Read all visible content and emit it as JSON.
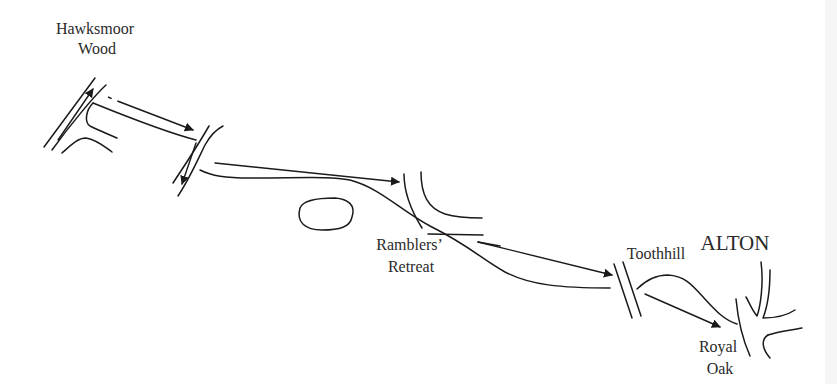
{
  "diagram": {
    "type": "route-map-sketch",
    "colors": {
      "ink": "#1a1a1a",
      "text": "#2a2a2a",
      "background": "#ffffff"
    },
    "places": [
      {
        "id": "hawksmoor-wood",
        "lines": [
          "Hawksmoor",
          "Wood"
        ]
      },
      {
        "id": "ramblers-retreat",
        "lines": [
          "Ramblers’",
          "Retreat"
        ]
      },
      {
        "id": "toothhill",
        "lines": [
          "Toothhill"
        ]
      },
      {
        "id": "alton",
        "lines": [
          "ALTON"
        ]
      },
      {
        "id": "royal-oak",
        "lines": [
          "Royal",
          "Oak"
        ]
      }
    ],
    "features": {
      "lake": "oval-pond",
      "icons": [
        "arrow-icon"
      ]
    }
  }
}
